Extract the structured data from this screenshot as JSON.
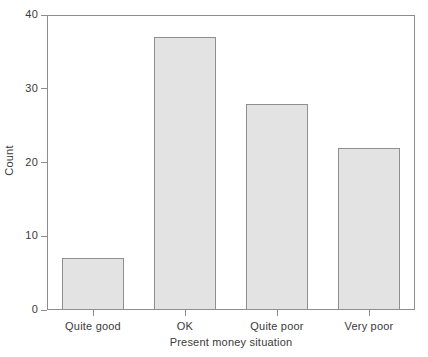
{
  "chart_data": {
    "type": "bar",
    "title": "",
    "subtitle": "",
    "categories": [
      "Quite good",
      "OK",
      "Quite poor",
      "Very poor"
    ],
    "values": [
      7,
      37,
      28,
      22
    ],
    "xlabel": "Present money situation",
    "ylabel": "Count",
    "ylim": [
      0,
      40
    ],
    "yticks": [
      0,
      10,
      20,
      30,
      40
    ],
    "ytick_labels": [
      "0",
      "10",
      "20",
      "30",
      "40"
    ],
    "grid": false,
    "legend": null,
    "legend_position": "none",
    "series": [
      {
        "name": "Count",
        "values": [
          7,
          37,
          28,
          22
        ]
      }
    ],
    "annotations": []
  },
  "style": {
    "bar_fill": "#e3e3e3",
    "bar_border": "#8f8f8f",
    "axis_color": "#8d8d8d",
    "text_color": "#3a3a3a",
    "background": "#ffffff"
  }
}
